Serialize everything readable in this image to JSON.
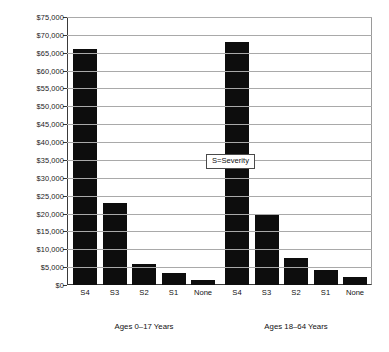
{
  "chart_data": {
    "type": "bar",
    "title": "",
    "subtitle": "",
    "xlabel": "",
    "ylabel": "",
    "ylim": [
      0,
      75000
    ],
    "ytick_step": 5000,
    "grid": true,
    "legend_position": "inside-right",
    "bar_color": "#0d0d0d",
    "categories": [
      "S4",
      "S3",
      "S2",
      "S1",
      "None",
      "S4",
      "S3",
      "S2",
      "S1",
      "None"
    ],
    "values": [
      66000,
      23000,
      5800,
      3300,
      1500,
      68000,
      19800,
      7500,
      4300,
      2200
    ],
    "ytick_labels": [
      "$0",
      "$5,000",
      "$10,000",
      "$15,000",
      "$20,000",
      "$25,000",
      "$30,000",
      "$35,000",
      "$40,000",
      "$45,000",
      "$50,000",
      "$55,000",
      "$60,000",
      "$65,000",
      "$70,000",
      "$75,000"
    ],
    "ytick_values": [
      0,
      5000,
      10000,
      15000,
      20000,
      25000,
      30000,
      35000,
      40000,
      45000,
      50000,
      55000,
      60000,
      65000,
      70000,
      75000
    ],
    "groups": [
      {
        "label": "Ages 0–17 Years",
        "categories": [
          "S4",
          "S3",
          "S2",
          "S1",
          "None"
        ],
        "values": [
          66000,
          23000,
          5800,
          3300,
          1500
        ]
      },
      {
        "label": "Ages 18–64 Years",
        "categories": [
          "S4",
          "S3",
          "S2",
          "S1",
          "None"
        ],
        "values": [
          68000,
          19800,
          7500,
          4300,
          2200
        ]
      }
    ],
    "annotations": [
      {
        "name": "severity-legend",
        "text": "S=Severity"
      }
    ]
  },
  "legend": {
    "text": "S=Severity"
  }
}
